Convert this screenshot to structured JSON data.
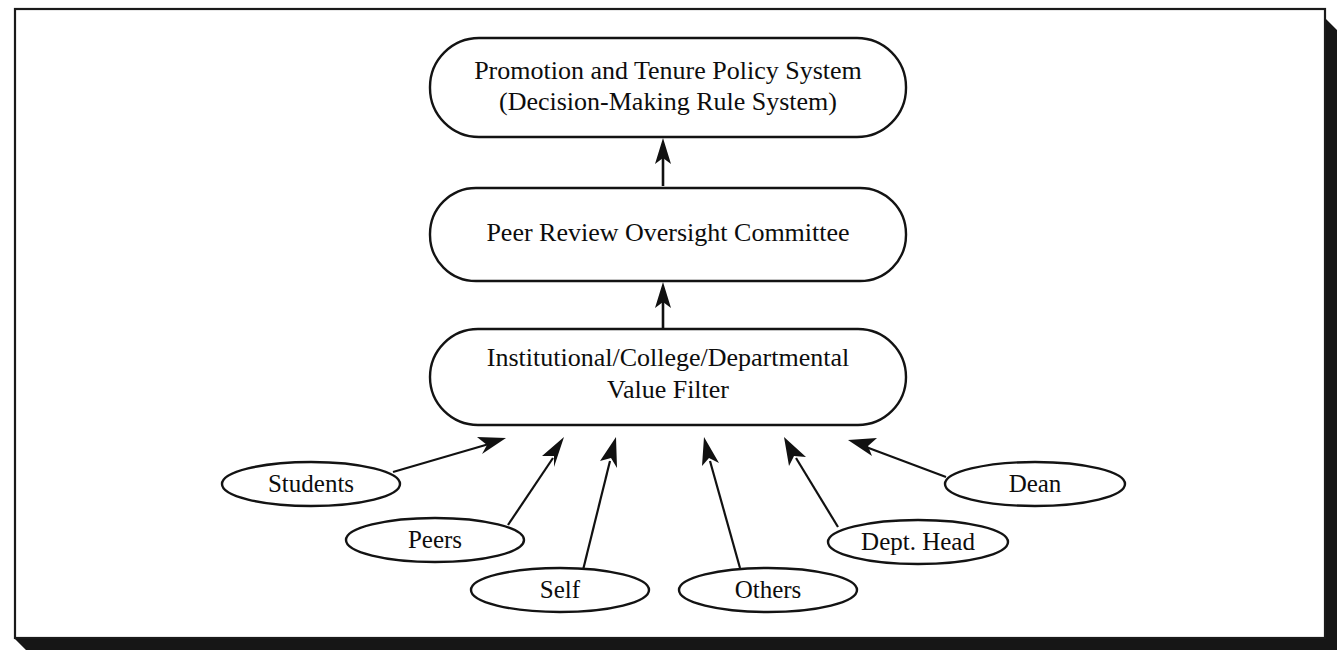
{
  "figure": {
    "title": "Promotion and Tenure Policy System",
    "frame": {
      "border_color": "#1a1a1a",
      "shadow_color": "#161616",
      "background_color": "#ffffff"
    }
  },
  "diagram": {
    "type": "flow-hierarchy",
    "orientation": "bottom-up",
    "ink_color": "#111111",
    "boxes": [
      {
        "id": "policy-system",
        "shape": "rounded-rectangle",
        "line1": "Promotion and Tenure Policy System",
        "line2": "(Decision-Making Rule System)"
      },
      {
        "id": "oversight-committee",
        "shape": "rounded-rectangle",
        "line1": "Peer Review Oversight Committee",
        "line2": ""
      },
      {
        "id": "value-filter",
        "shape": "rounded-rectangle",
        "line1": "Institutional/College/Departmental",
        "line2": "Value Filter"
      }
    ],
    "sources": [
      {
        "id": "students",
        "label": "Students"
      },
      {
        "id": "peers",
        "label": "Peers"
      },
      {
        "id": "self",
        "label": "Self"
      },
      {
        "id": "others",
        "label": "Others"
      },
      {
        "id": "dept-head",
        "label": "Dept. Head"
      },
      {
        "id": "dean",
        "label": "Dean"
      }
    ],
    "edges": [
      {
        "from": "oversight-committee",
        "to": "policy-system",
        "style": "arrow-up"
      },
      {
        "from": "value-filter",
        "to": "oversight-committee",
        "style": "arrow-up"
      },
      {
        "from": "students",
        "to": "value-filter",
        "style": "arrow-diagonal"
      },
      {
        "from": "peers",
        "to": "value-filter",
        "style": "arrow-diagonal"
      },
      {
        "from": "self",
        "to": "value-filter",
        "style": "arrow-diagonal"
      },
      {
        "from": "others",
        "to": "value-filter",
        "style": "arrow-diagonal"
      },
      {
        "from": "dept-head",
        "to": "value-filter",
        "style": "arrow-diagonal"
      },
      {
        "from": "dean",
        "to": "value-filter",
        "style": "arrow-diagonal"
      }
    ]
  }
}
